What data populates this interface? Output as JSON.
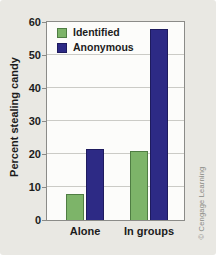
{
  "chart_data": {
    "type": "bar",
    "title": "",
    "categories": [
      "Alone",
      "In groups"
    ],
    "series": [
      {
        "name": "Identified",
        "color": "#7DB469",
        "border_color": "#4F7D43",
        "values": [
          8,
          21
        ]
      },
      {
        "name": "Anonymous",
        "color": "#2D2A85",
        "border_color": "#1E1B5E",
        "values": [
          21.5,
          58
        ]
      }
    ],
    "xlabel": "",
    "ylabel": "Percent stealing candy",
    "ylim": [
      0,
      60
    ],
    "yticks": [
      0,
      10,
      20,
      30,
      40,
      50,
      60
    ],
    "grid": true,
    "legend_position": "top-left-inside",
    "credit": "© Cengage Learning"
  }
}
